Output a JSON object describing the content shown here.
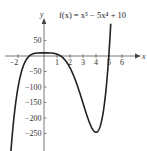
{
  "chart_data": {
    "type": "line",
    "title": "f(x) = x⁵ − 5x⁴ + 10",
    "function": "x^5 - 5x^4 + 10",
    "xlabel": "x",
    "ylabel": "y",
    "xlim": [
      -2.6,
      7.3
    ],
    "ylim": [
      -306,
      120
    ],
    "x_ticks": [
      -2,
      1,
      2,
      3,
      4,
      5,
      6
    ],
    "x_tick_labels": [
      "−2",
      "1",
      "2",
      "3",
      "4",
      "5",
      "6"
    ],
    "y_ticks": [
      50,
      -50,
      -100,
      -150,
      -200,
      -250
    ],
    "y_tick_labels": [
      "50",
      "−50",
      "−100",
      "−150",
      "−200",
      "−250"
    ],
    "grid": false,
    "legend": null,
    "series": [
      {
        "name": "f(x)",
        "x": [
          -2.55,
          -2.5,
          -2.25,
          -2,
          -1.75,
          -1.5,
          -1.25,
          -1,
          -0.75,
          -0.5,
          -0.25,
          0,
          0.25,
          0.5,
          0.75,
          1,
          1.5,
          2,
          2.5,
          3,
          3.5,
          4,
          4.5,
          5,
          5.1,
          5.13
        ],
        "values": [
          -309,
          -283,
          -181,
          -102,
          -63.8,
          -22.9,
          -5.2,
          4,
          7.3,
          9.7,
          9.98,
          10,
          9.98,
          9.72,
          8.65,
          6,
          -7.7,
          -38,
          -87.5,
          -152,
          -211.6,
          -246,
          -195.4,
          10,
          77.7,
          101
        ]
      }
    ],
    "key_points": {
      "local_max": {
        "x": 0,
        "y": 10
      },
      "local_min": {
        "x": 4,
        "y": -246
      }
    },
    "line_color": "#222222"
  }
}
